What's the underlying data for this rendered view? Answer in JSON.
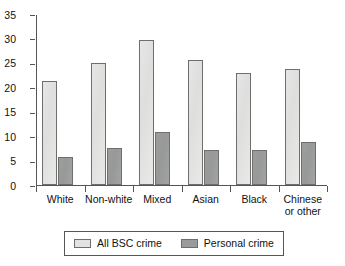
{
  "chart_data": {
    "type": "bar",
    "title": "",
    "subtitle": "",
    "xlabel": "",
    "ylabel": "",
    "ylim": [
      0,
      35
    ],
    "yticks": [
      0,
      5,
      10,
      15,
      20,
      25,
      30,
      35
    ],
    "grid": false,
    "legend_position": "bottom",
    "categories": [
      "White",
      "Non-white",
      "Mixed",
      "Asian",
      "Black",
      "Chinese\nor other"
    ],
    "category_lines": [
      [
        "White"
      ],
      [
        "Non-white"
      ],
      [
        "Mixed"
      ],
      [
        "Asian"
      ],
      [
        "Black"
      ],
      [
        "Chinese",
        "or other"
      ]
    ],
    "series": [
      {
        "name": "All BSC crime",
        "color": "#e3e3e2",
        "values": [
          21.2,
          24.9,
          29.6,
          25.6,
          22.9,
          23.7
        ]
      },
      {
        "name": "Personal crime",
        "color": "#9a9b9b",
        "values": [
          5.7,
          7.5,
          10.9,
          7.2,
          7.1,
          8.8
        ]
      }
    ]
  },
  "axis": {
    "y_tick_labels": [
      "0",
      "5",
      "10",
      "15",
      "20",
      "25",
      "30",
      "35"
    ]
  },
  "legend": {
    "items": [
      {
        "label": "All BSC crime",
        "swatch": "light-gray"
      },
      {
        "label": "Personal crime",
        "swatch": "medium-gray"
      }
    ]
  }
}
